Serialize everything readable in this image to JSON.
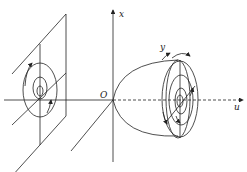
{
  "diagram": {
    "type": "coordinate-system-vortex-illustration",
    "axes": {
      "x_label": "x",
      "y_label": "y",
      "u_label": "u",
      "origin_label": "O"
    },
    "left_plane": {
      "description": "tilted plane with concentric circular streamlines and rotation arrows"
    },
    "right_body": {
      "description": "bell/paraboloid-shaped body opening toward +u with concentric elliptical rings and rotation arrows"
    },
    "colors": {
      "line": "#222222",
      "background": "#ffffff"
    }
  }
}
